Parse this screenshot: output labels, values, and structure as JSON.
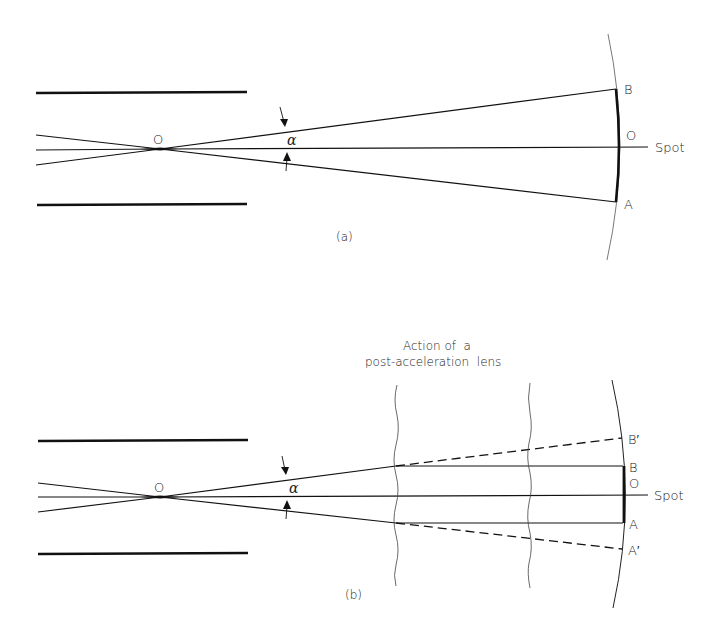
{
  "figure": {
    "panel_a": {
      "caption": "(a)",
      "labels": {
        "origin": "O",
        "angle": "α",
        "point_b": "B",
        "point_o": "O",
        "point_a": "A",
        "spot": "Spot"
      }
    },
    "panel_b": {
      "caption": "(b)",
      "title_line1": "Action of  a",
      "title_line2": "post-acceleration  lens",
      "labels": {
        "origin": "O",
        "angle": "α",
        "point_b_prime": "B′",
        "point_b": "B",
        "point_o": "O",
        "point_a": "A",
        "point_a_prime": "A′",
        "spot": "Spot"
      }
    },
    "colors": {
      "stroke": "#111111",
      "background": "#ffffff",
      "text": "#222222"
    }
  }
}
